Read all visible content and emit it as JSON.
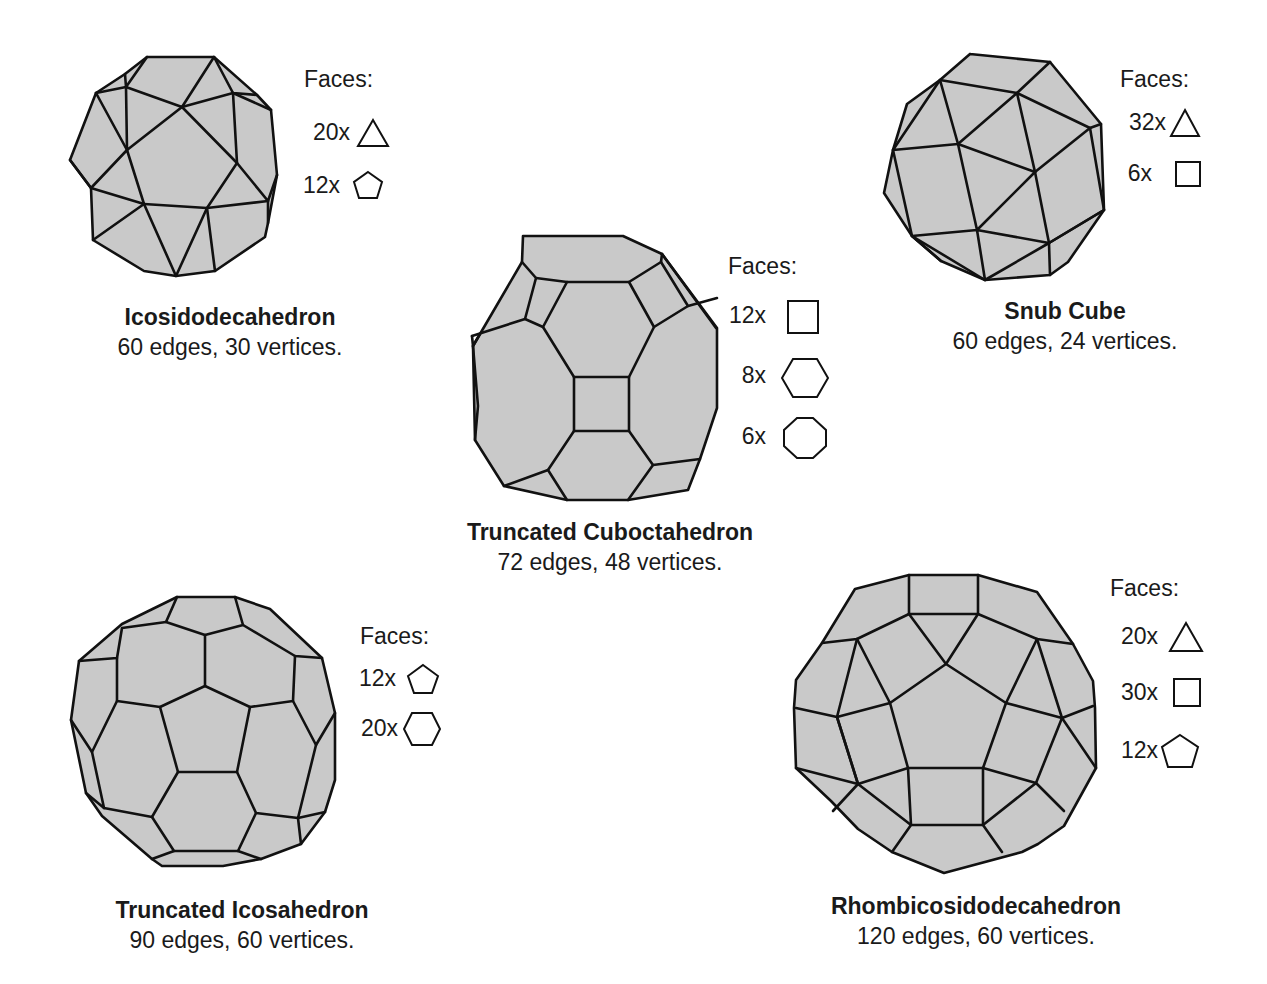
{
  "figure": {
    "background_color": "#ffffff",
    "face_fill_color": "#c9c9c9",
    "edge_color": "#111111",
    "legend_title": "Faces:"
  },
  "solids": [
    {
      "name": "Icosidodecahedron",
      "stats": "60 edges, 30 vertices.",
      "faces": [
        {
          "count": "20x",
          "shape": "triangle-icon"
        },
        {
          "count": "12x",
          "shape": "pentagon-icon"
        }
      ]
    },
    {
      "name": "Snub Cube",
      "stats": "60 edges, 24 vertices.",
      "faces": [
        {
          "count": "32x",
          "shape": "triangle-icon"
        },
        {
          "count": "6x",
          "shape": "square-icon"
        }
      ]
    },
    {
      "name": "Truncated Cuboctahedron",
      "stats": "72 edges, 48 vertices.",
      "faces": [
        {
          "count": "12x",
          "shape": "square-icon"
        },
        {
          "count": "8x",
          "shape": "hexagon-icon"
        },
        {
          "count": "6x",
          "shape": "octagon-icon"
        }
      ]
    },
    {
      "name": "Truncated Icosahedron",
      "stats": "90 edges, 60 vertices.",
      "faces": [
        {
          "count": "12x",
          "shape": "pentagon-icon"
        },
        {
          "count": "20x",
          "shape": "hexagon-icon"
        }
      ]
    },
    {
      "name": "Rhombicosidodecahedron",
      "stats": "120 edges, 60 vertices.",
      "faces": [
        {
          "count": "20x",
          "shape": "triangle-icon"
        },
        {
          "count": "30x",
          "shape": "square-icon"
        },
        {
          "count": "12x",
          "shape": "pentagon-icon"
        }
      ]
    }
  ]
}
